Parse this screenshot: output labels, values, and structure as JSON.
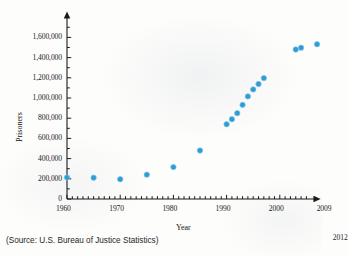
{
  "source_note": "(Source: U.S. Bureau of Justice Statistics)",
  "callout": {
    "year_2012_label": "2012"
  },
  "style": {
    "dot_color": "#2e9bd4",
    "axis_color": "#1a1a1a",
    "paper_color": "#fdfdfb"
  },
  "chart_data": {
    "type": "scatter",
    "title": "",
    "xlabel": "Year",
    "ylabel": "Prisoners",
    "xlim": [
      1960,
      2012
    ],
    "ylim": [
      0,
      1700000
    ],
    "grid": false,
    "legend": "none",
    "x_tick_interval": 1,
    "x_major_tick_labels": [
      "1960",
      "1970",
      "1980",
      "1990",
      "2000",
      "2009"
    ],
    "x_major_tick_values": [
      1960,
      1970,
      1980,
      1990,
      2000,
      2009
    ],
    "y_major_tick_labels": [
      "0",
      "200,000",
      "400,000",
      "600,000",
      "800,000",
      "1,000,000",
      "1,200,000",
      "1,400,000",
      "1,600,000"
    ],
    "y_major_tick_values": [
      0,
      200000,
      400000,
      600000,
      800000,
      1000000,
      1200000,
      1400000,
      1600000
    ],
    "y_minor_tick_interval": 100000,
    "points": [
      {
        "x": 1960,
        "y": 213000
      },
      {
        "x": 1965,
        "y": 210000
      },
      {
        "x": 1970,
        "y": 196000
      },
      {
        "x": 1975,
        "y": 241000
      },
      {
        "x": 1980,
        "y": 316000
      },
      {
        "x": 1985,
        "y": 480000
      },
      {
        "x": 1990,
        "y": 740000
      },
      {
        "x": 1991,
        "y": 790000
      },
      {
        "x": 1992,
        "y": 850000
      },
      {
        "x": 1993,
        "y": 932000
      },
      {
        "x": 1994,
        "y": 1016000
      },
      {
        "x": 1995,
        "y": 1085000
      },
      {
        "x": 1996,
        "y": 1138000
      },
      {
        "x": 1997,
        "y": 1197000
      },
      {
        "x": 2003,
        "y": 1480000
      },
      {
        "x": 2004,
        "y": 1497000
      },
      {
        "x": 2007,
        "y": 1532000
      },
      {
        "x": 2009,
        "y": 1613000
      },
      {
        "x": 2011,
        "y": 1574000
      }
    ]
  }
}
